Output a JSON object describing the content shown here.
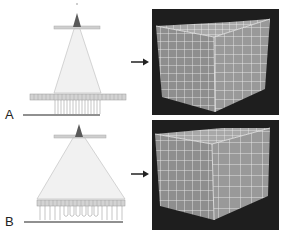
{
  "figure": {
    "panels": [
      {
        "label": "A",
        "description": "narrow beam collimation, detector elements partially irradiated",
        "arrow": "arrow-right"
      },
      {
        "label": "B",
        "description": "wide beam collimation, full detector array irradiated",
        "arrow": "arrow-right"
      }
    ],
    "colors": {
      "background": "#ffffff",
      "render_bg": "#1e1e1e",
      "cube_face": "#8a8a8a",
      "grid_line": "#e6e6e6",
      "beam_fill": "#efefef",
      "source": "#555555",
      "detector": "#c9c9c9"
    }
  }
}
